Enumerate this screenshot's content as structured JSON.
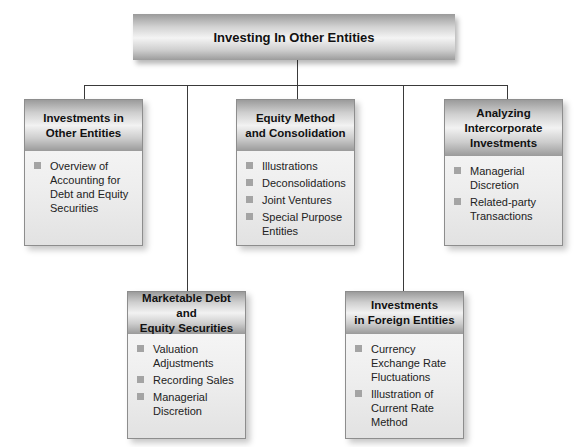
{
  "diagram": {
    "root": {
      "title": "Investing In Other Entities"
    },
    "branches": [
      {
        "title_line1": "Investments in",
        "title_line2": "Other Entities",
        "items": [
          "Overview of Accounting for Debt and Equity Securities"
        ]
      },
      {
        "title_line1": "Equity Method",
        "title_line2": "and Consolidation",
        "items": [
          "Illustrations",
          "Deconsolidations",
          "Joint Ventures",
          "Special Purpose Entities"
        ]
      },
      {
        "title_line1": "Analyzing",
        "title_line2": "Intercorporate",
        "title_line3": "Investments",
        "items": [
          "Managerial Discretion",
          "Related-party Transactions"
        ]
      },
      {
        "title_line1": "Marketable Debt and",
        "title_line2": "Equity Securities",
        "items": [
          "Valuation Adjustments",
          "Recording Sales",
          "Managerial Discretion"
        ]
      },
      {
        "title_line1": "Investments",
        "title_line2": "in Foreign Entities",
        "items": [
          "Currency Exchange Rate Fluctuations",
          "Illustration of Current Rate Method"
        ]
      }
    ],
    "colors": {
      "connector": "#3a3a3a",
      "bullet": "#a4a4a4",
      "border": "#8d8d8d"
    }
  }
}
